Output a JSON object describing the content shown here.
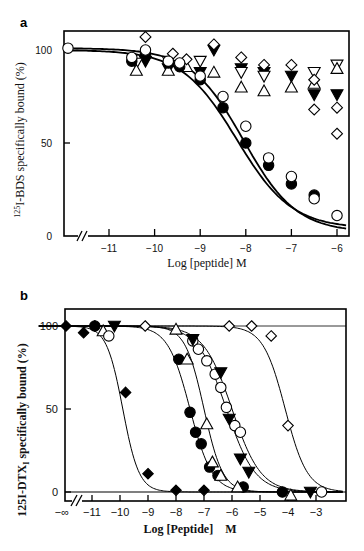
{
  "chart_data": [
    {
      "panel": "a",
      "type": "scatter",
      "title": "",
      "xlabel": "Log [peptide] M",
      "ylabel": "125I-BDS specifically bound (%)",
      "ylabel_parts": {
        "sup": "125",
        "rest": "I-BDS specifically bound (%)"
      },
      "xticks": [
        -11,
        -10,
        -9,
        -8,
        -7,
        -6
      ],
      "xtick_labels": [
        "−11",
        "−10",
        "−9",
        "−8",
        "−7",
        "−6"
      ],
      "yticks": [
        0,
        50,
        100
      ],
      "ytick_labels": [
        "0",
        "50",
        "100"
      ],
      "xlim": [
        -11.9,
        -5.75
      ],
      "ylim": [
        0,
        110
      ],
      "axis_break": true,
      "grid": false,
      "legend": null,
      "series": [
        {
          "name": "open circle",
          "marker": "circle-open",
          "x": [
            -11.9,
            -10.5,
            -10.2,
            -9.7,
            -9.45,
            -9.0,
            -8.5,
            -8.0,
            -7.5,
            -7.0,
            -6.5,
            -6.0
          ],
          "y": [
            101,
            96,
            100,
            94,
            93,
            86,
            75,
            59,
            42,
            32,
            20,
            11
          ],
          "fit": true
        },
        {
          "name": "filled circle",
          "marker": "circle-filled",
          "x": [
            -10.5,
            -10.2,
            -9.7,
            -9.45,
            -9.0,
            -8.5,
            -8.0,
            -7.5,
            -7.0,
            -6.5
          ],
          "y": [
            94,
            98,
            93,
            91,
            84,
            69,
            50,
            38,
            28,
            22
          ],
          "fit": true
        },
        {
          "name": "open triangle up",
          "marker": "triangle-up-open",
          "x": [
            -10.4,
            -9.7,
            -9.3,
            -8.7,
            -8.1,
            -7.6,
            -7.0,
            -6.5,
            -6.0
          ],
          "y": [
            89,
            89,
            91,
            88,
            80,
            78,
            80,
            82,
            90
          ],
          "fit": false
        },
        {
          "name": "open triangle down",
          "marker": "triangle-down-open",
          "x": [
            -10.4,
            -9.7,
            -9.0,
            -8.1,
            -7.6,
            -6.5,
            -6.0
          ],
          "y": [
            93,
            94,
            94,
            88,
            86,
            88,
            92
          ],
          "fit": false
        },
        {
          "name": "filled triangle down",
          "marker": "triangle-down-filled",
          "x": [
            -10.2,
            -9.7,
            -9.0,
            -8.7,
            -8.1,
            -7.6,
            -7.0,
            -6.5,
            -6.0
          ],
          "y": [
            94,
            90,
            88,
            100,
            90,
            88,
            86,
            76,
            76
          ],
          "fit": false
        },
        {
          "name": "open diamond",
          "marker": "diamond-open",
          "x": [
            -10.2,
            -9.6,
            -9.3,
            -8.7,
            -8.1,
            -7.6,
            -7.0,
            -6.5,
            -6.0
          ],
          "y": [
            107,
            98,
            95,
            103,
            96,
            92,
            92,
            84,
            69
          ],
          "extra": [
            {
              "x": -6.5,
              "y": 68
            },
            {
              "x": -6.0,
              "y": 55
            }
          ],
          "fit": false
        }
      ]
    },
    {
      "panel": "b",
      "type": "scatter",
      "title": "",
      "xlabel": "Log [Peptide]    M",
      "ylabel": "125I-DTXI specifically bound (%)",
      "ylabel_parts": {
        "pre": "125I-DTX",
        "sub": "I",
        "rest": " specifically bound (%)"
      },
      "xticks": [
        "-∞",
        -11,
        -10,
        -9,
        -8,
        -7,
        -6,
        -5,
        -4,
        -3
      ],
      "xtick_labels": [
        "−∞",
        "−11",
        "−10",
        "−9",
        "−8",
        "−7",
        "−6",
        "−5",
        "−4",
        "−3"
      ],
      "yticks": [
        0,
        50,
        100
      ],
      "ytick_labels": [
        "0",
        "50",
        "100"
      ],
      "xlim": [
        -12.9,
        -1.9
      ],
      "ylim": [
        -5,
        110
      ],
      "axis_break": true,
      "grid": false,
      "legend": null,
      "series": [
        {
          "name": "filled diamond",
          "marker": "diamond-filled",
          "x": [
            -12.8,
            -11.3,
            -10.9,
            -9.8,
            -9.0,
            -8.0,
            -7.0
          ],
          "y": [
            100,
            96,
            100,
            60,
            11,
            1,
            1
          ],
          "fit": true,
          "ic50_log": -9.9
        },
        {
          "name": "filled circle",
          "marker": "circle-filled",
          "x": [
            -10.9,
            -7.9,
            -7.5,
            -7.3,
            -7.1,
            -6.8,
            -6.5,
            -5.6,
            -4.2
          ],
          "y": [
            100,
            80,
            48,
            36,
            29,
            15,
            10,
            3,
            0
          ],
          "fit": true,
          "ic50_log": -7.5
        },
        {
          "name": "open triangle up",
          "marker": "triangle-up-open",
          "x": [
            -10.6,
            -8.0,
            -7.6,
            -6.9,
            -6.7,
            -6.4,
            -5.8,
            -3.9
          ],
          "y": [
            97,
            98,
            80,
            41,
            18,
            10,
            3,
            -2
          ],
          "fit": true,
          "ic50_log": -7.0
        },
        {
          "name": "open circle",
          "marker": "circle-open",
          "x": [
            -10.4,
            -7.4,
            -7.2,
            -6.9,
            -6.6,
            -6.4,
            -6.2,
            -5.9,
            -5.7,
            -2.8
          ],
          "y": [
            94,
            91,
            86,
            79,
            71,
            63,
            51,
            40,
            36,
            0
          ],
          "fit": true,
          "ic50_log": -6.2
        },
        {
          "name": "filled triangle down",
          "marker": "triangle-down-filled",
          "x": [
            -10.2,
            -7.4,
            -6.4,
            -6.1,
            -5.7,
            -5.4,
            -3.2
          ],
          "y": [
            100,
            92,
            72,
            44,
            20,
            12,
            0
          ],
          "fit": true,
          "ic50_log": -6.0
        },
        {
          "name": "open diamond",
          "marker": "diamond-open",
          "x": [
            -9.1,
            -6.1,
            -5.3,
            -4.6,
            -4.0
          ],
          "y": [
            100,
            100,
            100,
            94,
            40
          ],
          "fit": true,
          "ic50_log": -4.1
        }
      ]
    }
  ],
  "panels": {
    "a": {
      "letter": "a",
      "xlabel": "Log [peptide] M",
      "ylabel_sup": "125",
      "ylabel_rest": "I-BDS specifically bound (%)"
    },
    "b": {
      "letter": "b",
      "xlabel": "Log [Peptide]    M",
      "ylabel_pre": "125I-DTX",
      "ylabel_sub": "I",
      "ylabel_rest": " specifically bound (%)"
    }
  }
}
